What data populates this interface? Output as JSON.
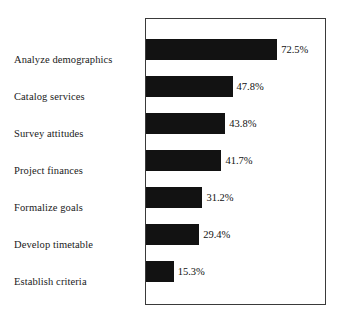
{
  "chart_data": {
    "type": "bar",
    "orientation": "horizontal",
    "title": "",
    "subtitle": "",
    "xlabel": "",
    "ylabel": "",
    "categories": [
      "Analyze demographics",
      "Catalog services",
      "Survey attitudes",
      "Project finances",
      "Formalize goals",
      "Develop timetable",
      "Establish criteria"
    ],
    "values": [
      72.5,
      47.8,
      43.8,
      41.7,
      31.2,
      29.4,
      15.3
    ],
    "value_labels": [
      "72.5%",
      "47.8%",
      "43.8%",
      "41.7%",
      "31.2%",
      "29.4%",
      "15.3%"
    ],
    "xlim": [
      0,
      80
    ],
    "grid": false,
    "legend": null,
    "annotations": [],
    "bar_color": "#121212",
    "frame_color": "#3a3a3a",
    "background_color": "#ffffff"
  }
}
